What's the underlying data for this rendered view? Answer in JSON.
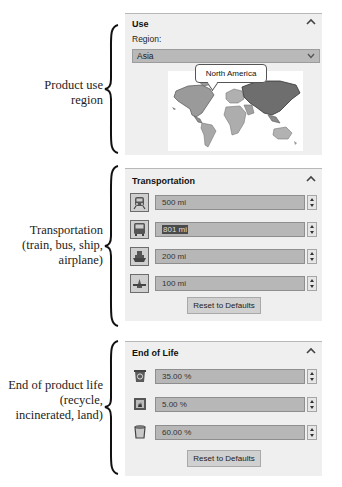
{
  "annotations": {
    "use": [
      "Product use",
      "region"
    ],
    "transport": [
      "Transportation",
      "(train, bus, ship,",
      "airplane)"
    ],
    "end_of_life": [
      "End of product life",
      "(recycle,",
      "incinerated, land)"
    ]
  },
  "use_panel": {
    "title": "Use",
    "region_label": "Region:",
    "region_value": "Asia",
    "map_tooltip": "North America",
    "icons": {
      "collapse": "chevron-up-icon",
      "dropdown": "chevron-down-icon",
      "map": "world-map"
    }
  },
  "transport_panel": {
    "title": "Transportation",
    "rows": [
      {
        "mode": "train",
        "icon": "train-icon",
        "value": "500 mi",
        "selected": false
      },
      {
        "mode": "bus",
        "icon": "bus-icon",
        "value": "801 mi",
        "selected": true
      },
      {
        "mode": "ship",
        "icon": "ship-icon",
        "value": "200 mi",
        "selected": false
      },
      {
        "mode": "airplane",
        "icon": "airplane-icon",
        "value": "100 mi",
        "selected": false
      }
    ],
    "reset_label": "Reset to Defaults"
  },
  "eol_panel": {
    "title": "End of Life",
    "rows": [
      {
        "mode": "recycle",
        "icon": "recycle-bin-icon",
        "value": "35.00 %"
      },
      {
        "mode": "incinerated",
        "icon": "incinerator-icon",
        "value": "5.00 %"
      },
      {
        "mode": "landfill",
        "icon": "landfill-bin-icon",
        "value": "60.00 %"
      }
    ],
    "reset_label": "Reset to Defaults"
  },
  "colors": {
    "panel_bg": "#efefef",
    "field_bg": "#b7b7b7",
    "highlight_region": "#6e6e6e",
    "other_region": "#a8a8a8"
  }
}
